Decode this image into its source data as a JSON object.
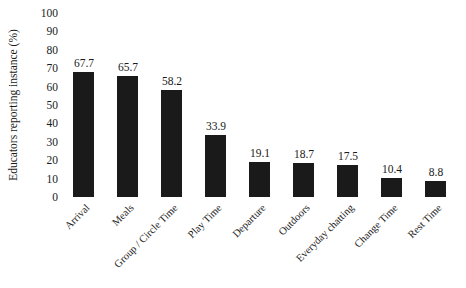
{
  "chart_data": {
    "type": "bar",
    "title": "",
    "subtitle": "",
    "xlabel": "",
    "ylabel": "Educators reporting instance (%)",
    "categories": [
      "Arrival",
      "Meals",
      "Group / Circle Time",
      "Play Time",
      "Departure",
      "Outdoors",
      "Everyday chatting",
      "Change Time",
      "Rest Time"
    ],
    "values": [
      67.7,
      65.7,
      58.2,
      33.9,
      19.1,
      18.7,
      17.5,
      10.4,
      8.8
    ],
    "value_labels": [
      "67.7",
      "65.7",
      "58.2",
      "33.9",
      "19.1",
      "18.7",
      "17.5",
      "10.4",
      "8.8"
    ],
    "ylim": [
      0,
      100
    ],
    "ytick_labels": [
      "100",
      "90",
      "80",
      "70",
      "60",
      "50",
      "40",
      "30",
      "20",
      "10",
      "0"
    ],
    "ytick_values": [
      100,
      90,
      80,
      70,
      60,
      50,
      40,
      30,
      20,
      10,
      0
    ],
    "grid": false,
    "legend": false,
    "legend_position": "none",
    "bar_color": "#1a1a1a",
    "background_color": "#ffffff",
    "xtick_label_rotation": -45
  }
}
